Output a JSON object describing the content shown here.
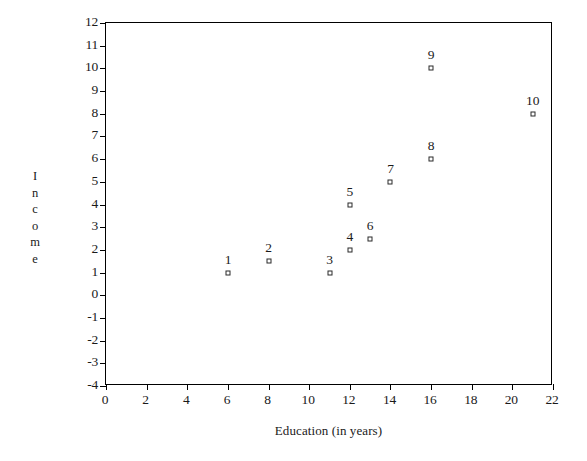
{
  "chart_data": {
    "type": "scatter",
    "title": "",
    "xlabel": "Education (in years)",
    "ylabel": "Income",
    "ylabel_letters": [
      "I",
      "n",
      "c",
      "o",
      "m",
      "e"
    ],
    "xlim": [
      0,
      22
    ],
    "ylim": [
      -4,
      12
    ],
    "xticks": [
      0,
      2,
      4,
      6,
      8,
      10,
      12,
      14,
      16,
      18,
      20,
      22
    ],
    "yticks": [
      -4,
      -3,
      -2,
      -1,
      0,
      1,
      2,
      3,
      4,
      5,
      6,
      7,
      8,
      9,
      10,
      11,
      12
    ],
    "xtick_labels": [
      "0",
      "2",
      "4",
      "6",
      "8",
      "10",
      "12",
      "14",
      "16",
      "18",
      "20",
      "22"
    ],
    "ytick_labels": [
      "-4",
      "-3",
      "-2",
      "-1",
      "0",
      "1",
      "2",
      "3",
      "4",
      "5",
      "6",
      "7",
      "8",
      "9",
      "10",
      "11",
      "12"
    ],
    "grid": false,
    "legend": false,
    "marker": "open-square",
    "marker_color": "#2a2a2a",
    "points": [
      {
        "label": "1",
        "x": 6,
        "y": 1.0
      },
      {
        "label": "2",
        "x": 8,
        "y": 1.5
      },
      {
        "label": "3",
        "x": 11,
        "y": 1.0
      },
      {
        "label": "4",
        "x": 12,
        "y": 2.0
      },
      {
        "label": "5",
        "x": 12,
        "y": 4.0
      },
      {
        "label": "6",
        "x": 13,
        "y": 2.5
      },
      {
        "label": "7",
        "x": 14,
        "y": 5.0
      },
      {
        "label": "8",
        "x": 16,
        "y": 6.0
      },
      {
        "label": "9",
        "x": 16,
        "y": 10.0
      },
      {
        "label": "10",
        "x": 21,
        "y": 8.0
      }
    ]
  }
}
